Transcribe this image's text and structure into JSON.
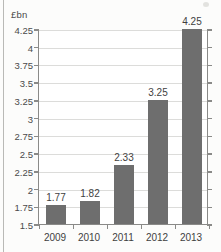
{
  "chart_data": {
    "type": "bar",
    "title": "",
    "subtitle": "",
    "xlabel": "",
    "ylabel": "£bn",
    "categories": [
      "2009",
      "2010",
      "2011",
      "2012",
      "2013"
    ],
    "values": [
      1.77,
      1.82,
      2.33,
      3.25,
      4.25
    ],
    "data_labels": [
      "1.77",
      "1.82",
      "2.33",
      "3.25",
      "4.25"
    ],
    "ylim": [
      1.5,
      4.25
    ],
    "ytick_labels": [
      "4.25",
      "4",
      "3.75",
      "3.5",
      "3.25",
      "3",
      "2.75",
      "2.5",
      "2.25",
      "2",
      "1.75",
      "1.5"
    ],
    "ytick_values": [
      4.25,
      4,
      3.75,
      3.5,
      3.25,
      3,
      2.75,
      2.5,
      2.25,
      2,
      1.75,
      1.5
    ],
    "grid": true,
    "legend": null,
    "series": [
      {
        "name": "",
        "values": [
          1.77,
          1.82,
          2.33,
          3.25,
          4.25
        ]
      }
    ],
    "colors": {
      "bar_fill": "#6e6e6e",
      "gridline": "#dcdcda",
      "axis_line": "#8a8a88",
      "text": "#3f3f3f",
      "plot_background": "#ffffff",
      "page_background": "#fcfcfb"
    }
  }
}
